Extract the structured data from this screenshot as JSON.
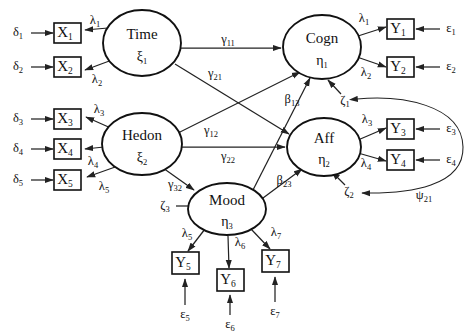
{
  "diagram": {
    "type": "structural-equation-model-path-diagram",
    "title": "",
    "background_color": "#ffffff",
    "line_color": "#222222",
    "text_color": "#111111"
  },
  "observed_indicators_x": [
    {
      "id": "x1",
      "label": "X",
      "subscript": "1",
      "x": 67,
      "y": 33
    },
    {
      "id": "x2",
      "label": "X",
      "subscript": "2",
      "x": 67,
      "y": 67
    },
    {
      "id": "x3",
      "label": "X",
      "subscript": "3",
      "x": 67,
      "y": 119
    },
    {
      "id": "x4",
      "label": "X",
      "subscript": "4",
      "x": 67,
      "y": 149
    },
    {
      "id": "x5",
      "label": "X",
      "subscript": "5",
      "x": 67,
      "y": 180
    }
  ],
  "observed_indicators_y": [
    {
      "id": "y1",
      "label": "Y",
      "subscript": "1",
      "x": 400,
      "y": 29
    },
    {
      "id": "y2",
      "label": "Y",
      "subscript": "2",
      "x": 400,
      "y": 67
    },
    {
      "id": "y3",
      "label": "Y",
      "subscript": "3",
      "x": 400,
      "y": 129
    },
    {
      "id": "y4",
      "label": "Y",
      "subscript": "4",
      "x": 400,
      "y": 160
    },
    {
      "id": "y5",
      "label": "Y",
      "subscript": "5",
      "x": 185,
      "y": 264
    },
    {
      "id": "y6",
      "label": "Y",
      "subscript": "6",
      "x": 230,
      "y": 280
    },
    {
      "id": "y7",
      "label": "Y",
      "subscript": "7",
      "x": 275,
      "y": 262
    }
  ],
  "latent_variables": [
    {
      "id": "time",
      "name": "Time",
      "greek": "ξ",
      "greek_sub": "1",
      "cx": 142,
      "cy": 43,
      "rx": 39,
      "ry": 33
    },
    {
      "id": "hedon",
      "name": "Hedon",
      "greek": "ξ",
      "greek_sub": "2",
      "cx": 142,
      "cy": 144,
      "rx": 40,
      "ry": 31
    },
    {
      "id": "mood",
      "name": "Mood",
      "greek": "η",
      "greek_sub": "3",
      "cx": 227,
      "cy": 209,
      "rx": 39,
      "ry": 26
    },
    {
      "id": "cogn",
      "name": "Cogn",
      "greek": "η",
      "greek_sub": "1",
      "cx": 322,
      "cy": 47,
      "rx": 39,
      "ry": 32
    },
    {
      "id": "aff",
      "name": "Aff",
      "greek": "η",
      "greek_sub": "2",
      "cx": 324,
      "cy": 147,
      "rx": 37,
      "ry": 29
    }
  ],
  "error_terms_delta": [
    {
      "id": "d1",
      "symbol": "δ",
      "subscript": "1",
      "x": 18,
      "y": 33
    },
    {
      "id": "d2",
      "symbol": "δ",
      "subscript": "2",
      "x": 18,
      "y": 67
    },
    {
      "id": "d3",
      "symbol": "δ",
      "subscript": "3",
      "x": 18,
      "y": 119
    },
    {
      "id": "d4",
      "symbol": "δ",
      "subscript": "4",
      "x": 18,
      "y": 149
    },
    {
      "id": "d5",
      "symbol": "δ",
      "subscript": "5",
      "x": 18,
      "y": 180
    }
  ],
  "error_terms_epsilon": [
    {
      "id": "e1",
      "symbol": "ε",
      "subscript": "1",
      "x": 451,
      "y": 29
    },
    {
      "id": "e2",
      "symbol": "ε",
      "subscript": "2",
      "x": 451,
      "y": 67
    },
    {
      "id": "e3",
      "symbol": "ε",
      "subscript": "3",
      "x": 451,
      "y": 129
    },
    {
      "id": "e4",
      "symbol": "ε",
      "subscript": "4",
      "x": 451,
      "y": 160
    },
    {
      "id": "e5",
      "symbol": "ε",
      "subscript": "5",
      "x": 185,
      "y": 315
    },
    {
      "id": "e6",
      "symbol": "ε",
      "subscript": "6",
      "x": 230,
      "y": 325
    },
    {
      "id": "e7",
      "symbol": "ε",
      "subscript": "7",
      "x": 275,
      "y": 312
    }
  ],
  "disturbances_zeta": [
    {
      "id": "z1",
      "symbol": "ζ",
      "subscript": "1",
      "x": 345,
      "y": 101
    },
    {
      "id": "z2",
      "symbol": "ζ",
      "subscript": "2",
      "x": 349,
      "y": 192
    },
    {
      "id": "z3",
      "symbol": "ζ",
      "subscript": "3",
      "x": 165,
      "y": 206
    }
  ],
  "loading_labels": [
    {
      "id": "lam1_x",
      "symbol": "λ",
      "subscript": "1",
      "x": 95,
      "y": 21
    },
    {
      "id": "lam2_x",
      "symbol": "λ",
      "subscript": "2",
      "x": 97,
      "y": 80
    },
    {
      "id": "lam3_x",
      "symbol": "λ",
      "subscript": "3",
      "x": 99,
      "y": 110
    },
    {
      "id": "lam4_x",
      "symbol": "λ",
      "subscript": "4",
      "x": 93,
      "y": 162
    },
    {
      "id": "lam5_x",
      "symbol": "λ",
      "subscript": "5",
      "x": 104,
      "y": 187
    },
    {
      "id": "lam1_y",
      "symbol": "λ",
      "subscript": "1",
      "x": 364,
      "y": 19
    },
    {
      "id": "lam2_y",
      "symbol": "λ",
      "subscript": "2",
      "x": 366,
      "y": 73
    },
    {
      "id": "lam3_y",
      "symbol": "λ",
      "subscript": "3",
      "x": 367,
      "y": 120
    },
    {
      "id": "lam4_y",
      "symbol": "λ",
      "subscript": "4",
      "x": 366,
      "y": 164
    },
    {
      "id": "lam5_m",
      "symbol": "λ",
      "subscript": "5",
      "x": 187,
      "y": 234
    },
    {
      "id": "lam6_m",
      "symbol": "λ",
      "subscript": "6",
      "x": 240,
      "y": 243
    },
    {
      "id": "lam7_m",
      "symbol": "λ",
      "subscript": "7",
      "x": 276,
      "y": 233
    }
  ],
  "structural_labels": [
    {
      "id": "g11",
      "symbol": "γ",
      "subscript": "11",
      "x": 228,
      "y": 40
    },
    {
      "id": "g21",
      "symbol": "γ",
      "subscript": "21",
      "x": 215,
      "y": 74
    },
    {
      "id": "g12",
      "symbol": "γ",
      "subscript": "12",
      "x": 211,
      "y": 131
    },
    {
      "id": "g22",
      "symbol": "γ",
      "subscript": "22",
      "x": 228,
      "y": 157
    },
    {
      "id": "g32",
      "symbol": "γ",
      "subscript": "32",
      "x": 175,
      "y": 185
    },
    {
      "id": "b13",
      "symbol": "β",
      "subscript": "13",
      "x": 292,
      "y": 100
    },
    {
      "id": "b23",
      "symbol": "β",
      "subscript": "23",
      "x": 284,
      "y": 181
    },
    {
      "id": "psi21",
      "symbol": "ψ",
      "subscript": "21",
      "x": 424,
      "y": 196
    }
  ]
}
